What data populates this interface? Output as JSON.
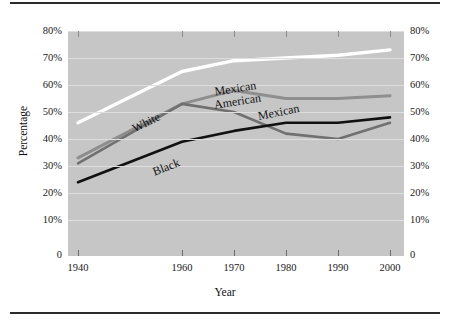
{
  "chart_data": {
    "type": "line",
    "title": "",
    "xlabel": "Year",
    "ylabel": "Percentage",
    "x": [
      1940,
      1960,
      1970,
      1980,
      1990,
      2000
    ],
    "xtick_labels": [
      "1940",
      "1960",
      "1970",
      "1980",
      "1990",
      "2000"
    ],
    "ytick_labels": [
      "0",
      "10%",
      "20%",
      "30%",
      "40%",
      "50%",
      "60%",
      "70%",
      "80%"
    ],
    "ytick_values": [
      0,
      10,
      20,
      30,
      40,
      50,
      60,
      70,
      80
    ],
    "ylim": [
      0,
      84
    ],
    "xlim": [
      1936,
      2002
    ],
    "grid": true,
    "grid_axis": "y",
    "legend_position": "inline-annotations",
    "dual_y_axis": true,
    "plot_background": "#c6c6c6",
    "series": [
      {
        "name": "White",
        "label": "White",
        "color": "#ffffff",
        "values": [
          46,
          65,
          69,
          70,
          71,
          73
        ]
      },
      {
        "name": "Mexican American",
        "label": "Mexican American",
        "label_line1": "Mexican",
        "label_line2": "American",
        "color": "#8e8e8e",
        "values": [
          33,
          53,
          58,
          55,
          55,
          56
        ]
      },
      {
        "name": "Mexican",
        "label": "Mexican",
        "color": "#707070",
        "values": [
          31,
          53,
          50,
          42,
          40,
          46
        ]
      },
      {
        "name": "Black",
        "label": "Black",
        "color": "#111111",
        "values": [
          24,
          39,
          43,
          46,
          46,
          48
        ]
      }
    ],
    "annotations": [
      {
        "text": "White",
        "series": "White",
        "x_pct": 22,
        "y_pct": 48,
        "rotation": -27
      },
      {
        "text": "Mexican American",
        "series": "Mexican American",
        "x_pct": 47,
        "y_pct": 63,
        "rotation": -12
      },
      {
        "text": "Mexican",
        "series": "Mexican",
        "x_pct": 59,
        "y_pct": 52,
        "rotation": -12
      },
      {
        "text": "Black",
        "series": "Black",
        "x_pct": 29,
        "y_pct": 37,
        "rotation": -22
      }
    ]
  },
  "axis": {
    "y_left_labels": [
      "80%",
      "70%",
      "60%",
      "50%",
      "40%",
      "30%",
      "20%",
      "10%",
      "0"
    ],
    "y_right_labels": [
      "80%",
      "70%",
      "60%",
      "50%",
      "40%",
      "30%",
      "20%",
      "10%",
      "0"
    ],
    "x_labels": [
      "1940",
      "1960",
      "1970",
      "1980",
      "1990",
      "2000"
    ],
    "y_title": "Percentage",
    "x_title": "Year"
  },
  "labels": {
    "white": "White",
    "mexican_american_l1": "Mexican",
    "mexican_american_l2": "American",
    "mexican": "Mexican",
    "black": "Black"
  }
}
